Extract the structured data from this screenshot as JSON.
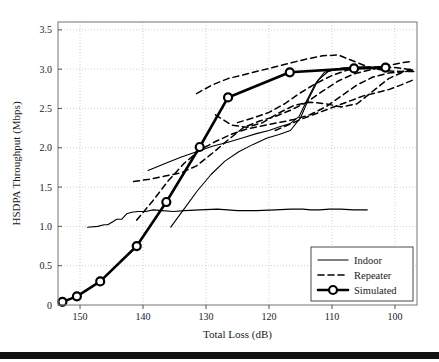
{
  "figure": {
    "background_color": "#ffffff",
    "axis_color": "#808080",
    "grid_color": "#b9b9b9",
    "series_color": "#000000"
  },
  "chart_data": {
    "type": "line",
    "title": "",
    "xlabel": "Total Loss (dB)",
    "ylabel": "HSDPA Throughput (Mbps)",
    "xlim": [
      153.5,
      96.5
    ],
    "ylim": [
      0,
      3.6
    ],
    "x_inverted": true,
    "grid": true,
    "xticks": [
      150,
      140,
      130,
      120,
      110,
      100
    ],
    "xticklabels": [
      "150",
      "140",
      "130",
      "120",
      "110",
      "100"
    ],
    "yticks": [
      0,
      0.5,
      1.0,
      1.5,
      2.0,
      2.5,
      3.0,
      3.5
    ],
    "yticklabels": [
      "0",
      "0.5",
      "1.0",
      "1.5",
      "2.0",
      "2.5",
      "3.0",
      "3.5"
    ],
    "legend_position": "lower right",
    "legend_entries": [
      {
        "label": "Indoor",
        "style": "solid-thin",
        "marker": "none"
      },
      {
        "label": "Repeater",
        "style": "dashed",
        "marker": "none"
      },
      {
        "label": "Simulated",
        "style": "solid-thick",
        "marker": "circle"
      }
    ],
    "series": [
      {
        "name": "Simulated",
        "style": "solid-thick",
        "marker": "circle",
        "x": [
          152.8,
          150.5,
          146.8,
          141.0,
          136.3,
          131.0,
          126.5,
          116.7,
          106.5,
          101.5
        ],
        "y": [
          0.04,
          0.11,
          0.3,
          0.75,
          1.31,
          2.01,
          2.64,
          2.96,
          3.01,
          3.02
        ]
      },
      {
        "name": "Indoor-1",
        "style": "solid-thin",
        "marker": "none",
        "x": [
          148.8,
          147.2,
          146.2,
          145.6,
          144.8,
          144.2,
          143.4,
          142.6,
          141.8,
          140.8,
          139.6,
          138.4,
          137.0,
          135.2,
          133.4,
          131.0,
          128.2,
          125.0,
          122.0,
          119.0,
          116.5,
          114.6,
          113.4,
          112.0,
          110.4,
          108.6,
          106.6,
          104.4
        ],
        "y": [
          0.99,
          1.0,
          1.02,
          1.02,
          1.06,
          1.09,
          1.09,
          1.16,
          1.18,
          1.19,
          1.19,
          1.21,
          1.2,
          1.19,
          1.2,
          1.21,
          1.22,
          1.2,
          1.2,
          1.21,
          1.22,
          1.22,
          1.21,
          1.21,
          1.22,
          1.22,
          1.21,
          1.21
        ]
      },
      {
        "name": "Indoor-2",
        "style": "solid-thin",
        "marker": "none",
        "x": [
          139.2,
          136.5,
          134.0,
          131.5,
          129.0,
          126.5,
          124.0,
          122.0,
          120.0,
          118.2,
          116.6,
          115.2,
          114.0,
          112.6,
          111.2,
          109.4,
          107.4,
          105.0,
          102.6
        ],
        "y": [
          1.71,
          1.8,
          1.88,
          1.95,
          2.02,
          2.07,
          2.13,
          2.18,
          2.22,
          2.27,
          2.31,
          2.4,
          2.6,
          2.82,
          2.96,
          3.0,
          3.02,
          3.03,
          3.02
        ]
      },
      {
        "name": "Indoor-3",
        "style": "solid-thin",
        "marker": "none",
        "x": [
          135.6,
          133.5,
          131.4,
          129.2,
          127.0,
          124.8,
          122.6,
          120.4,
          118.4,
          116.6,
          115.0,
          113.6,
          112.2,
          110.6,
          108.6,
          106.4,
          104.0
        ],
        "y": [
          0.99,
          1.22,
          1.45,
          1.66,
          1.83,
          1.95,
          2.04,
          2.12,
          2.17,
          2.22,
          2.38,
          2.64,
          2.86,
          2.97,
          3.01,
          3.02,
          3.02
        ]
      },
      {
        "name": "Repeater-1",
        "style": "dashed",
        "marker": "none",
        "x": [
          141.5,
          139.0,
          136.5,
          134.0,
          131.5,
          129.0,
          126.5,
          124.0,
          121.5,
          119.0,
          116.5,
          114.0,
          111.5,
          109.0,
          106.5,
          104.0,
          101.5,
          99.0,
          97.2
        ],
        "y": [
          1.57,
          1.6,
          1.64,
          1.68,
          1.77,
          1.93,
          2.1,
          2.26,
          2.34,
          2.4,
          2.48,
          2.58,
          2.72,
          2.85,
          2.94,
          2.99,
          3.04,
          3.08,
          3.1
        ]
      },
      {
        "name": "Repeater-2",
        "style": "dashed",
        "marker": "none",
        "x": [
          141.0,
          138.5,
          136.0,
          133.5,
          131.0,
          128.5,
          126.0,
          123.5,
          121.0,
          118.5,
          116.0,
          113.5,
          111.0,
          108.5,
          106.0,
          103.5,
          101.0,
          98.5,
          97.0
        ],
        "y": [
          1.08,
          1.32,
          1.58,
          1.8,
          1.97,
          2.08,
          2.17,
          2.24,
          2.28,
          2.32,
          2.36,
          2.42,
          2.52,
          2.66,
          2.8,
          2.9,
          2.95,
          2.97,
          2.97
        ]
      },
      {
        "name": "Repeater-3",
        "style": "dashed",
        "marker": "none",
        "x": [
          131.5,
          129.0,
          126.5,
          124.0,
          121.5,
          119.0,
          116.5,
          114.0,
          111.5,
          109.0,
          106.5,
          104.0,
          101.5,
          99.0,
          97.2
        ],
        "y": [
          2.69,
          2.8,
          2.88,
          2.93,
          2.98,
          3.03,
          3.08,
          3.13,
          3.17,
          3.18,
          3.1,
          3.02,
          2.98,
          2.97,
          2.99
        ]
      },
      {
        "name": "Repeater-4",
        "style": "dashed",
        "marker": "none",
        "x": [
          128.5,
          126.0,
          123.5,
          121.0,
          118.5,
          116.0,
          113.5,
          111.0,
          108.5,
          106.0,
          103.5,
          101.0,
          98.8,
          97.1
        ],
        "y": [
          2.42,
          2.29,
          2.26,
          2.32,
          2.44,
          2.54,
          2.58,
          2.56,
          2.52,
          2.56,
          2.72,
          2.88,
          2.96,
          2.99
        ]
      },
      {
        "name": "Repeater-5",
        "style": "dashed",
        "marker": "none",
        "x": [
          125.0,
          122.5,
          120.0,
          117.5,
          115.0,
          112.5,
          110.0,
          107.5,
          105.0,
          102.5,
          100.0,
          98.0,
          97.0
        ],
        "y": [
          2.32,
          2.38,
          2.45,
          2.56,
          2.7,
          2.82,
          2.92,
          2.99,
          3.02,
          3.03,
          3.02,
          3.0,
          3.0
        ]
      },
      {
        "name": "Repeater-6",
        "style": "dashed",
        "marker": "none",
        "x": [
          119.0,
          117.0,
          115.0,
          113.0,
          111.0,
          109.0,
          107.0,
          105.0,
          103.0,
          101.0,
          99.0,
          97.2
        ],
        "y": [
          2.22,
          2.29,
          2.36,
          2.42,
          2.48,
          2.54,
          2.6,
          2.66,
          2.7,
          2.74,
          2.8,
          2.86
        ]
      }
    ]
  }
}
